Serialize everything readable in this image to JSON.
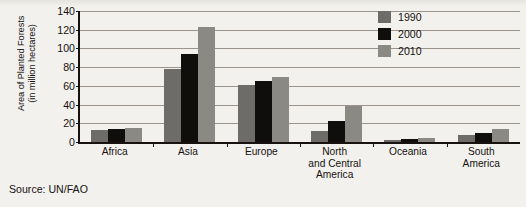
{
  "chart_data": {
    "type": "bar",
    "title": "",
    "xlabel": "",
    "ylabel": "Area of Planted Forests (in million hectares)",
    "ylabel_line1": "Area of Planted Forests",
    "ylabel_line2": "(in million hectares)",
    "ylim": [
      0,
      140
    ],
    "ytick_step": 20,
    "yticks": [
      0,
      20,
      40,
      60,
      80,
      100,
      120,
      140
    ],
    "grid": true,
    "legend_position": "top-right",
    "categories": [
      "Africa",
      "Asia",
      "Europe",
      "North and Central America",
      "Oceania",
      "South America"
    ],
    "category_label_lines": [
      [
        "Africa"
      ],
      [
        "Asia"
      ],
      [
        "Europe"
      ],
      [
        "North",
        "and Central",
        "America"
      ],
      [
        "Oceania"
      ],
      [
        "South",
        "America"
      ]
    ],
    "series": [
      {
        "name": "1990",
        "color": "#6e6c68",
        "values": [
          13,
          78,
          61,
          12,
          2,
          7
        ]
      },
      {
        "name": "2000",
        "color": "#100e0c",
        "values": [
          14,
          94,
          65,
          22,
          3,
          10
        ]
      },
      {
        "name": "2010",
        "color": "#8b8984",
        "values": [
          15,
          123,
          69,
          39,
          4,
          14
        ]
      }
    ]
  },
  "source": {
    "text": "Source:  UN/FAO"
  }
}
